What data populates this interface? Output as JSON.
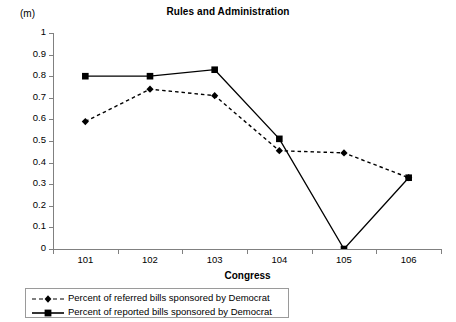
{
  "chart_data": {
    "type": "line",
    "title": "Rules and Administration",
    "xlabel": "Congress",
    "ylabel": "(m)",
    "categories": [
      "101",
      "102",
      "103",
      "104",
      "105",
      "106"
    ],
    "ylim": [
      0,
      1
    ],
    "ytick_labels": [
      "1",
      "0.9",
      "0.8",
      "0.7",
      "0.6",
      "0.5",
      "0.4",
      "0.3",
      "0.2",
      "0.1",
      "0"
    ],
    "ytick_values": [
      1,
      0.9,
      0.8,
      0.7,
      0.6,
      0.5,
      0.4,
      0.3,
      0.2,
      0.1,
      0
    ],
    "grid": false,
    "legend_position": "bottom-left",
    "series": [
      {
        "name": "Percent of referred bills sponsored by Democrat",
        "style": "dashed",
        "marker": "diamond",
        "color": "#000000",
        "values": [
          0.59,
          0.74,
          0.71,
          0.455,
          0.445,
          0.33
        ]
      },
      {
        "name": "Percent of reported bills sponsored by Democrat",
        "style": "solid",
        "marker": "square",
        "color": "#000000",
        "values": [
          0.8,
          0.8,
          0.83,
          0.51,
          0.0,
          0.33
        ]
      }
    ]
  },
  "legend": {
    "items": [
      {
        "label": "Percent of referred bills sponsored by Democrat"
      },
      {
        "label": "Percent of reported bills sponsored by Democrat"
      }
    ]
  }
}
